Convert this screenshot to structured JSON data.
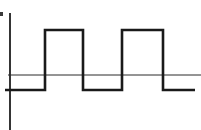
{
  "figure": {
    "title": "",
    "background_color": "#ffffff",
    "width": 201,
    "height": 130
  },
  "axes": {
    "vertical_axis_name": "y-axis",
    "horizontal_axis_name": "x-axis (zero reference line)",
    "axis_color": "#2b2b2b",
    "vertical_axis": {
      "x": 10,
      "y_top": 13,
      "y_bottom": 130,
      "stroke_width": 1.9
    },
    "horizontal_axis": {
      "y": 75,
      "x_start": 8,
      "x_end": 201,
      "stroke_width": 1.0
    },
    "tick_labels_x": [],
    "tick_labels_y": [],
    "xlabel": "",
    "ylabel": ""
  },
  "marks": {
    "corner_speck": {
      "x": 0,
      "y": 12,
      "width": 3,
      "height": 4,
      "color": "#3a3a3a"
    }
  },
  "chart_data": {
    "type": "line",
    "title": "",
    "subtitle": "",
    "xlabel": "",
    "ylabel": "",
    "legend": [],
    "grid": false,
    "waveform_name": "square-wave-pulse-train",
    "line_color": "#1a1a1a",
    "line_width": 2.6,
    "levels": {
      "high": 1,
      "low": -1,
      "zero_reference": 0
    },
    "pixel_levels": {
      "high_y": 30,
      "low_y": 90,
      "zero_y": 75
    },
    "x": [
      5,
      45,
      45,
      83,
      83,
      122,
      122,
      163,
      163,
      195
    ],
    "y": [
      -1,
      -1,
      1,
      1,
      -1,
      -1,
      1,
      1,
      -1,
      -1
    ],
    "segments": [
      {
        "index": 0,
        "level": "low",
        "value": -1,
        "x_start": 5,
        "x_end": 45
      },
      {
        "index": 1,
        "level": "high",
        "value": 1,
        "x_start": 45,
        "x_end": 83
      },
      {
        "index": 2,
        "level": "low",
        "value": -1,
        "x_start": 83,
        "x_end": 122
      },
      {
        "index": 3,
        "level": "high",
        "value": 1,
        "x_start": 122,
        "x_end": 163
      },
      {
        "index": 4,
        "level": "low",
        "value": -1,
        "x_start": 163,
        "x_end": 195
      }
    ],
    "transitions": [
      {
        "x": 45,
        "direction": "rising"
      },
      {
        "x": 83,
        "direction": "falling"
      },
      {
        "x": 122,
        "direction": "rising"
      },
      {
        "x": 163,
        "direction": "falling"
      }
    ],
    "pulse_count": 2,
    "ylim": [
      -1.6,
      1.6
    ],
    "xlim": [
      0,
      201
    ],
    "path_d": "M 5 90 L 45 90 L 45 30 L 83 30 L 83 90 L 122 90 L 122 30 L 163 30 L 163 90 L 195 90"
  }
}
